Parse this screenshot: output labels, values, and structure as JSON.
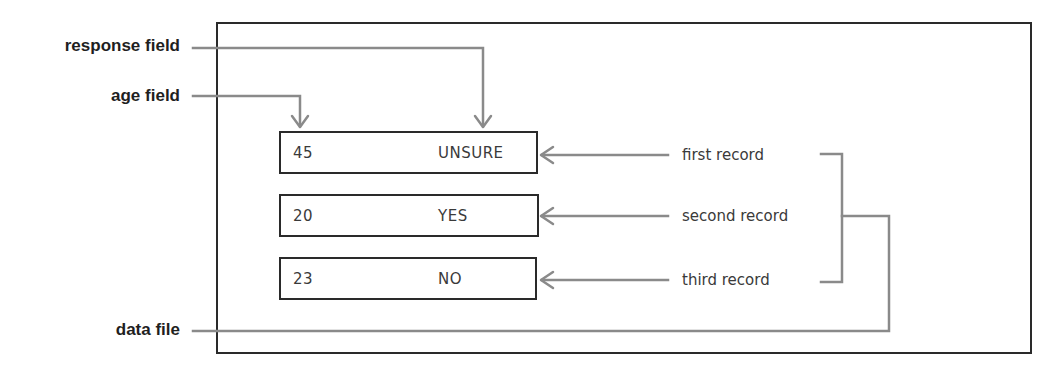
{
  "diagram": {
    "labels": {
      "response_field": "response field",
      "age_field": "age field",
      "data_file": "data file"
    },
    "records": [
      {
        "age": "45",
        "response": "UNSURE",
        "label": "first record"
      },
      {
        "age": "20",
        "response": "YES",
        "label": "second record"
      },
      {
        "age": "23",
        "response": "NO",
        "label": "third record"
      }
    ],
    "colors": {
      "outline": "#2a2a2a",
      "connector": "#8a8a8a",
      "label_text": "#1f1f1f",
      "record_text": "#3a3a3a",
      "background": "#ffffff"
    }
  }
}
